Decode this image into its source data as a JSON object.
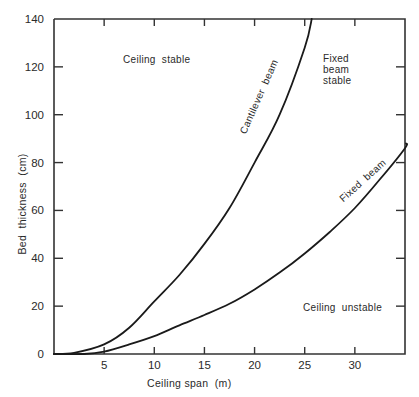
{
  "chart_data": {
    "type": "line",
    "title": "",
    "xlabel": "Ceiling span  (m)",
    "ylabel": "Bed  thickness  (cm)",
    "xlim": [
      0,
      35
    ],
    "ylim": [
      0,
      140
    ],
    "x_ticks": [
      5,
      10,
      15,
      20,
      25,
      30
    ],
    "x_tick_labels": [
      "5",
      "10",
      "15",
      "20",
      "25",
      "30"
    ],
    "y_ticks": [
      0,
      20,
      40,
      60,
      80,
      100,
      120,
      140
    ],
    "y_tick_labels": [
      "0",
      "20",
      "40",
      "60",
      "80",
      "100",
      "120",
      "140"
    ],
    "grid": false,
    "legend": "none (curves labeled inline)",
    "series": [
      {
        "name": "Cantilever beam",
        "x": [
          0,
          2,
          5,
          7.5,
          10,
          12.5,
          15,
          17.5,
          20,
          22.5,
          25,
          25.7
        ],
        "values": [
          0,
          0.5,
          4,
          11,
          22,
          33,
          46,
          61,
          80,
          100,
          128,
          140
        ]
      },
      {
        "name": "Fixed beam",
        "x": [
          0,
          3,
          5,
          7.5,
          10,
          12.5,
          15,
          17.5,
          20,
          22.5,
          25,
          27.5,
          30,
          32.5,
          35,
          35.1
        ],
        "values": [
          0,
          0,
          1,
          4,
          7.5,
          12,
          16.3,
          21,
          27,
          34,
          42,
          51,
          61,
          73,
          86,
          88
        ]
      }
    ],
    "annotations": [
      {
        "text": "Ceiling stable",
        "x": 7,
        "y": 123
      },
      {
        "text": "Fixed beam stable",
        "x": 27,
        "y": 123
      },
      {
        "text": "Ceiling unstable",
        "x": 25,
        "y": 20
      },
      {
        "text": "Cantilever beam",
        "along_series": "Cantilever beam"
      },
      {
        "text": "Fixed beam",
        "along_series": "Fixed beam"
      }
    ]
  },
  "labels": {
    "ceiling_stable": "Ceiling  stable",
    "fixed_beam_stable_1": "Fixed",
    "fixed_beam_stable_2": "beam",
    "fixed_beam_stable_3": "stable",
    "ceiling_unstable": "Ceiling  unstable",
    "cantilever_curve": "Cantilever  beam",
    "fixed_curve": "Fixed  beam"
  },
  "colors": {
    "axis": "#333333",
    "curve": "#1a1a1a",
    "text": "#2a2a2a",
    "background": "#ffffff"
  }
}
